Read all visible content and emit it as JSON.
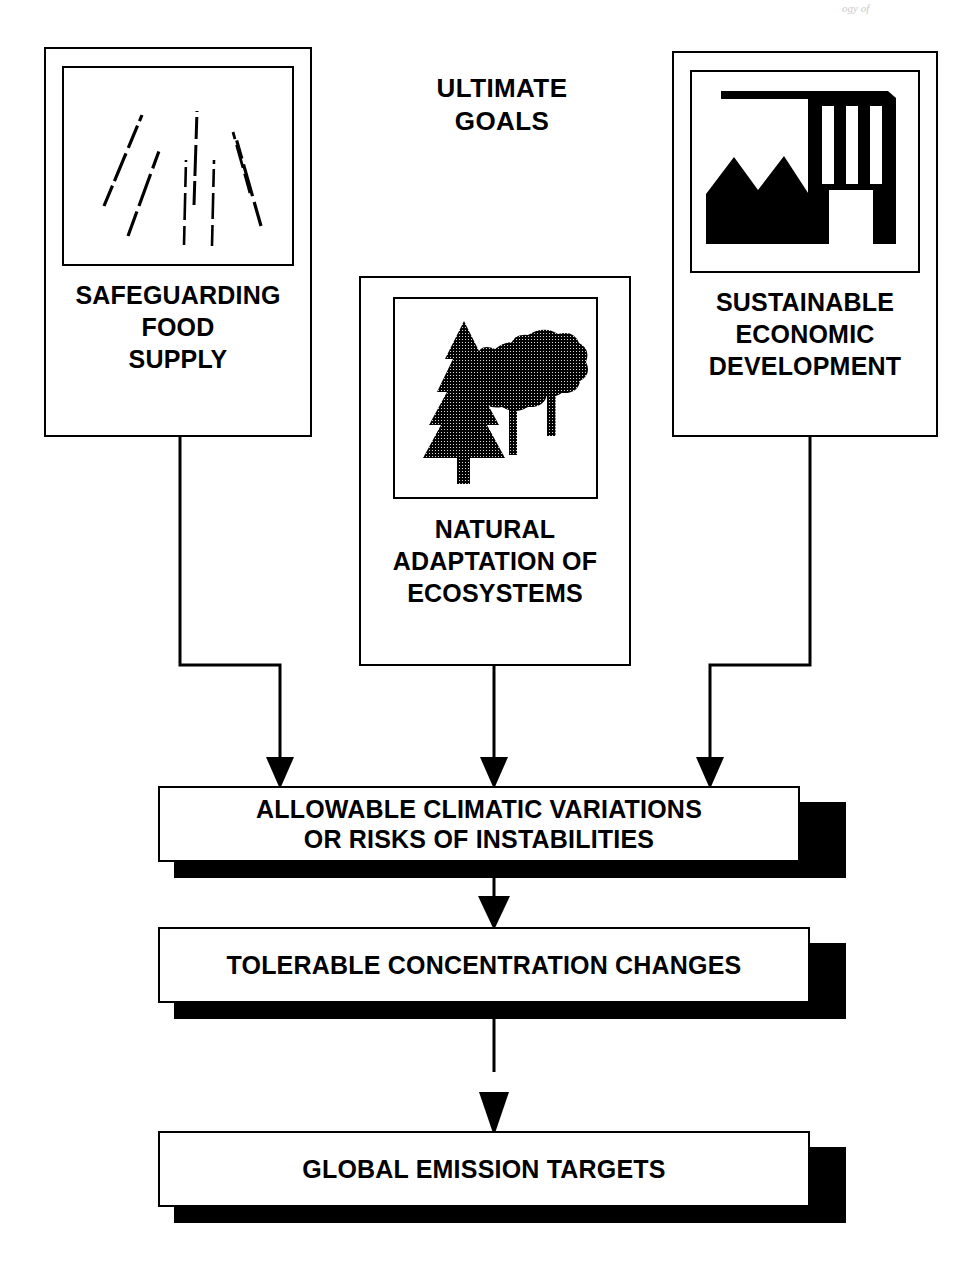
{
  "diagram": {
    "header": {
      "line1": "ULTIMATE",
      "line2": "GOALS"
    },
    "artifact_text": "ogy of",
    "goals": [
      {
        "id": "safeguarding-food-supply",
        "icon": "rainfall-icon",
        "label_lines": [
          "SAFEGUARDING",
          "FOOD",
          "SUPPLY"
        ]
      },
      {
        "id": "natural-adaptation-of-ecosystems",
        "icon": "forest-trees-icon",
        "label_lines": [
          "NATURAL",
          "ADAPTATION OF",
          "ECOSYSTEMS"
        ]
      },
      {
        "id": "sustainable-economic-development",
        "icon": "factory-icon",
        "label_lines": [
          "SUSTAINABLE",
          "ECONOMIC",
          "DEVELOPMENT"
        ]
      }
    ],
    "outcomes": [
      {
        "id": "allowable-climatic-variations",
        "lines": [
          "ALLOWABLE CLIMATIC VARIATIONS",
          "OR RISKS OF INSTABILITIES"
        ]
      },
      {
        "id": "tolerable-concentration-changes",
        "lines": [
          "TOLERABLE CONCENTRATION CHANGES"
        ]
      },
      {
        "id": "global-emission-targets",
        "lines": [
          "GLOBAL EMISSION TARGETS"
        ]
      }
    ],
    "colors": {
      "ink": "#000000",
      "paper": "#ffffff"
    }
  }
}
